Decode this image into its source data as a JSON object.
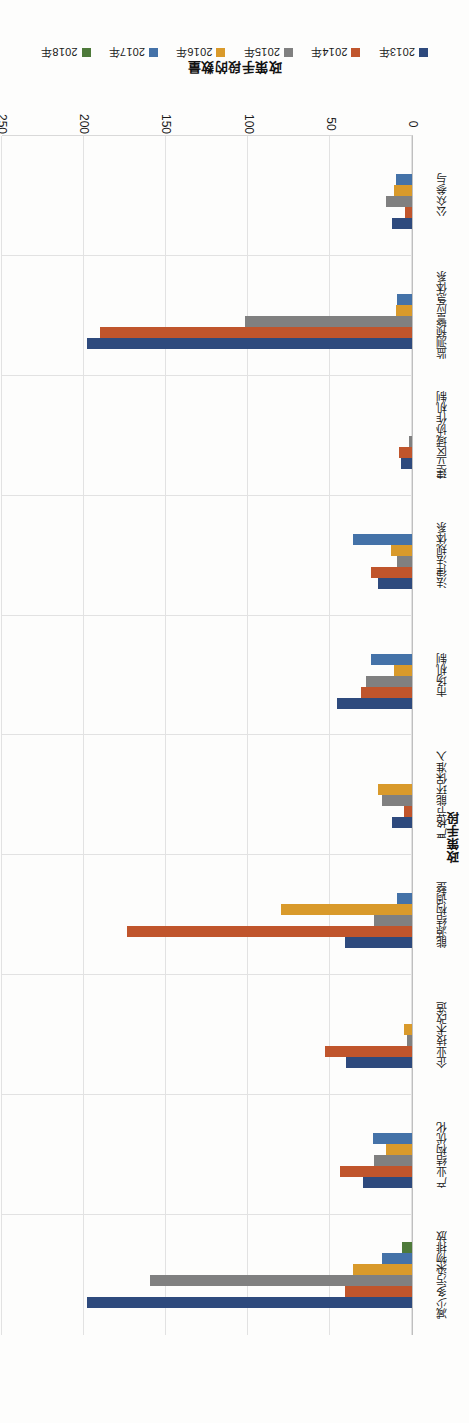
{
  "chart_data": {
    "type": "bar",
    "orientation": "horizontal",
    "title": "",
    "xlabel": "政策手段",
    "ylabel": "政策手段的数量",
    "ylim": [
      0,
      250
    ],
    "yticks": [
      "0",
      "50",
      "100",
      "150",
      "200",
      "250"
    ],
    "grid": true,
    "legend_position": "top",
    "categories": [
      "减少多污染物排放",
      "产业结构优化",
      "企业技术改造",
      "能源结构调整",
      "严格节能环保准入",
      "市场机制",
      "法律法规体系",
      "建立区域协作机制",
      "监测预警应急体系",
      "公众参与"
    ],
    "series": [
      {
        "name": "2013年",
        "color": "#2E4A7D",
        "values": [
          198,
          30,
          40,
          41,
          12,
          46,
          21,
          7,
          198,
          12
        ]
      },
      {
        "name": "2014年",
        "color": "#C0552C",
        "values": [
          41,
          44,
          53,
          174,
          5,
          31,
          25,
          8,
          190,
          4
        ]
      },
      {
        "name": "2015年",
        "color": "#808080",
        "values": [
          160,
          23,
          3,
          23,
          18,
          28,
          9,
          2,
          102,
          16
        ]
      },
      {
        "name": "2016年",
        "color": "#D99A2B",
        "values": [
          36,
          16,
          5,
          80,
          21,
          11,
          13,
          0,
          10,
          11
        ]
      },
      {
        "name": "2017年",
        "color": "#4472A8",
        "values": [
          18,
          24,
          0,
          9,
          0,
          25,
          36,
          0,
          9,
          10
        ]
      },
      {
        "name": "2018年",
        "color": "#4E7A3A",
        "values": [
          6,
          0,
          0,
          0,
          0,
          0,
          0,
          0,
          0,
          0
        ]
      }
    ]
  }
}
